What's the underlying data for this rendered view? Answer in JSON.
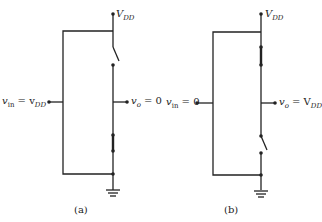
{
  "diagram": {
    "a": {
      "vdd_label": "V",
      "vdd_sub": "DD",
      "vin_label": "v",
      "vin_sub": "in",
      "vin_eq": " = v",
      "vin_eq_sub": "DD",
      "vo_label": "v",
      "vo_sub": "o",
      "vo_eq": " = 0",
      "caption": "(a)",
      "top_switch": "open",
      "bottom_switch": "closed"
    },
    "b": {
      "vdd_label": "V",
      "vdd_sub": "DD",
      "vin_label": "v",
      "vin_sub": "in",
      "vin_eq": " = 0",
      "vo_label": "v",
      "vo_sub": "o",
      "vo_eq": " = V",
      "vo_eq_sub": "DD",
      "caption": "(b)",
      "top_switch": "closed",
      "bottom_switch": "open"
    }
  }
}
